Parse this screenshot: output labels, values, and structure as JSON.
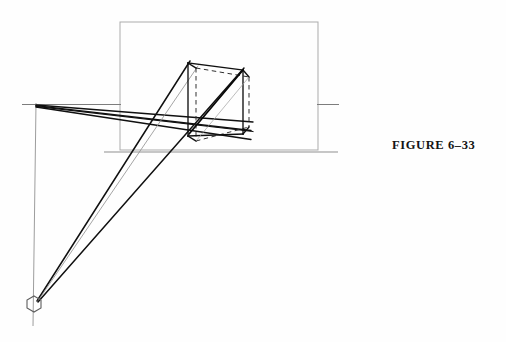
{
  "figure": {
    "caption": "FIGURE 6–33",
    "caption_position": {
      "x": 392,
      "y": 138
    },
    "background_color": "#fefefe",
    "ink_color": "#111111",
    "construction_line_color": "#9a9a9a"
  },
  "diagram": {
    "type": "line-drawing",
    "canvas": {
      "width": 506,
      "height": 342
    },
    "elements": {
      "picture_plane_rectangle": {
        "name": "picture-plane-rectangle",
        "x1": 120,
        "y1": 22,
        "x2": 318,
        "y2": 150,
        "stroke": "#a8a8a8",
        "stroke_width": 1
      },
      "horizon_line_left": {
        "name": "horizon-line-left",
        "x1": 22,
        "y1": 104,
        "x2": 120,
        "y2": 104,
        "stroke": "#7d7d7d",
        "stroke_width": 1
      },
      "horizon_line_right": {
        "name": "horizon-line-right",
        "x1": 318,
        "y1": 104,
        "x2": 338,
        "y2": 104,
        "stroke": "#7d7d7d",
        "stroke_width": 1
      },
      "ground_line": {
        "name": "ground-line",
        "x1": 104,
        "y1": 152,
        "x2": 338,
        "y2": 152,
        "stroke": "#8c8c8c",
        "stroke_width": 1
      },
      "vertical_measuring_line": {
        "name": "vertical-measuring-line",
        "x1": 36,
        "y1": 104,
        "x2": 33,
        "y2": 326,
        "stroke": "#9a9a9a",
        "stroke_width": 1
      },
      "left_vanishing_point": {
        "name": "left-vanishing-point",
        "x": 36,
        "y": 104,
        "label": "VPL"
      },
      "station_point_marker": {
        "name": "station-point-hexagon",
        "x": 34,
        "y": 304,
        "radius": 8,
        "sides": 6,
        "stroke": "#555555",
        "fill": "none"
      },
      "box": {
        "name": "rectangular-box",
        "front_top_left": {
          "x": 188,
          "y": 63
        },
        "front_top_right": {
          "x": 243,
          "y": 70
        },
        "front_bottom_left": {
          "x": 188,
          "y": 136
        },
        "front_bottom_right": {
          "x": 243,
          "y": 134
        },
        "back_top_left": {
          "x": 196,
          "y": 68
        },
        "back_top_right": {
          "x": 249,
          "y": 77
        },
        "back_bottom_left": {
          "x": 196,
          "y": 141
        },
        "back_bottom_right": {
          "x": 249,
          "y": 127
        },
        "stroke": "#151515",
        "stroke_width": 1.3,
        "hidden_edge_style": "dashed"
      },
      "vanishing_rays": [
        {
          "name": "ray-vpl-to-box-top-front",
          "x1": 36,
          "y1": 105,
          "x2": 250,
          "y2": 130,
          "weight": 1.5
        },
        {
          "name": "ray-vpl-to-box-top-back",
          "x1": 36,
          "y1": 106,
          "x2": 252,
          "y2": 122,
          "weight": 1.5
        },
        {
          "name": "ray-vpl-to-box-bottom-front",
          "x1": 36,
          "y1": 107,
          "x2": 250,
          "y2": 139,
          "weight": 1.5
        },
        {
          "name": "ray-vpl-to-box-bottom-back",
          "x1": 36,
          "y1": 108,
          "x2": 252,
          "y2": 131,
          "weight": 1.5
        }
      ],
      "station_rays": [
        {
          "name": "ray-sp-to-box-top-left",
          "x1": 37,
          "y1": 301,
          "x2": 190,
          "y2": 62,
          "weight": 1.5
        },
        {
          "name": "ray-sp-to-box-top-right",
          "x1": 37,
          "y1": 302,
          "x2": 243,
          "y2": 69,
          "weight": 1.5
        },
        {
          "name": "ray-sp-to-box-corner",
          "x1": 37,
          "y1": 302,
          "x2": 197,
          "y2": 67,
          "weight": 0.9
        }
      ],
      "box_diagonal": {
        "name": "box-face-diagonal",
        "x1": 189,
        "y1": 134,
        "x2": 243,
        "y2": 71,
        "weight": 1.6
      }
    }
  }
}
